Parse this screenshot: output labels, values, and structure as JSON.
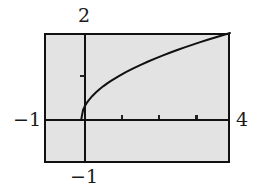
{
  "chart_data": {
    "type": "line",
    "title": "",
    "subtitle": "",
    "xlabel": "",
    "ylabel": "",
    "function": "y = sqrt(x)",
    "xlim": [
      -1,
      4
    ],
    "ylim": [
      -1,
      2
    ],
    "grid": false,
    "legend": false,
    "legend_position": "none",
    "axis_labels": {
      "y_max": "2",
      "x_min": "−1",
      "x_max": "4",
      "y_min": "−1"
    },
    "x_ticks": [
      1,
      2,
      3
    ],
    "y_ticks": [
      1
    ],
    "x_tick_labels": [
      "",
      "",
      ""
    ],
    "y_tick_labels": [
      ""
    ],
    "series": [
      {
        "name": "y = sqrt(x)",
        "color": "#111111",
        "x": [
          0,
          0.05,
          0.1,
          0.15,
          0.2,
          0.3,
          0.4,
          0.5,
          0.6,
          0.7,
          0.8,
          0.9,
          1.0,
          1.2,
          1.4,
          1.6,
          1.8,
          2.0,
          2.2,
          2.4,
          2.6,
          2.8,
          3.0,
          3.2,
          3.4,
          3.6,
          3.8,
          4.0
        ],
        "values": [
          0,
          0.224,
          0.316,
          0.387,
          0.447,
          0.548,
          0.632,
          0.707,
          0.775,
          0.837,
          0.894,
          0.949,
          1.0,
          1.095,
          1.183,
          1.265,
          1.342,
          1.414,
          1.483,
          1.549,
          1.612,
          1.673,
          1.732,
          1.789,
          1.844,
          1.897,
          1.949,
          2.0
        ]
      }
    ],
    "colors": {
      "curve": "#111111",
      "axis": "#111111",
      "frame": "#111111",
      "plot_background": "#e3e3e3",
      "page_background": "#ffffff",
      "label_text": "#1a1a1a"
    }
  }
}
